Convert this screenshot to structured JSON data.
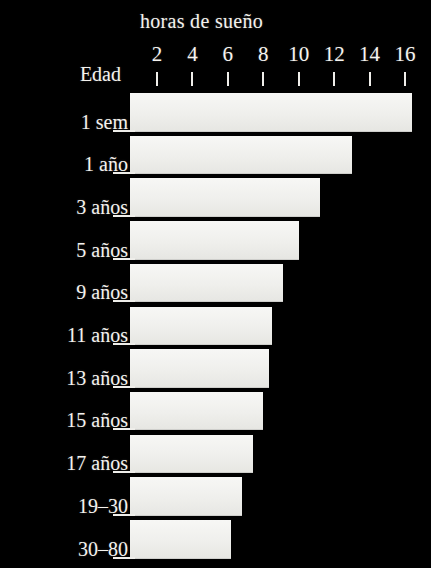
{
  "chart_data": {
    "type": "bar",
    "orientation": "horizontal",
    "title": "horas de sueño",
    "xlabel": "horas de sueño",
    "ylabel": "Edad",
    "xlim": [
      0,
      17
    ],
    "grid": false,
    "legend": null,
    "background_color": "#000000",
    "bar_color": "#f0f0ec",
    "text_color": "#f4f2ee",
    "xticks": [
      2,
      4,
      6,
      8,
      10,
      12,
      14,
      16
    ],
    "xtick_labels": [
      "2",
      "4",
      "6",
      "8",
      "10",
      "12",
      "14",
      "16"
    ],
    "categories": [
      "1 sem",
      "1 año",
      "3 años",
      "5 años",
      "9 años",
      "11 años",
      "13 años",
      "15 años",
      "17 años",
      "19–30",
      "30–80"
    ],
    "values": [
      16.4,
      13.0,
      11.2,
      10.0,
      9.1,
      8.5,
      8.3,
      8.0,
      7.4,
      6.8,
      6.2
    ]
  },
  "axis": {
    "y_title": "Edad"
  }
}
